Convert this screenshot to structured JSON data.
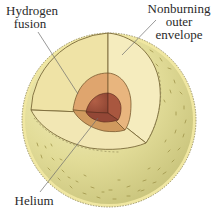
{
  "diagram": {
    "labels": {
      "hydrogen_fusion": {
        "line1": "Hydrogen",
        "line2": "fusion"
      },
      "nonburning_envelope": {
        "line1": "Nonburning",
        "line2": "outer",
        "line3": "envelope"
      },
      "helium": {
        "line1": "Helium"
      }
    },
    "layers": [
      {
        "name": "Helium core",
        "color": "#a4533f"
      },
      {
        "name": "Hydrogen fusion shell",
        "color": "#dba06a"
      },
      {
        "name": "Nonburning outer envelope",
        "color": "#f3e5ae"
      }
    ],
    "colors": {
      "sphere_surface": "#ddd78f",
      "sphere_shadow": "#c9c47a",
      "rim": "#f1e9a6",
      "outline": "#7a6a3a",
      "texture": "#a89a4c"
    }
  }
}
